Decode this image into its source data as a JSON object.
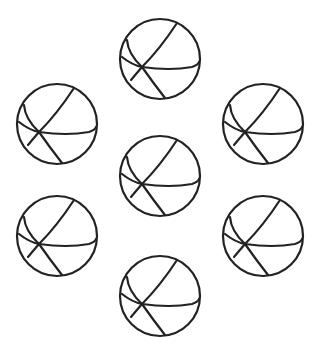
{
  "figure": {
    "background_color": "#ffffff",
    "stroke_color": "#222222",
    "ball_count": 7,
    "balls": [
      {
        "id": "top",
        "cx": 160,
        "cy": 59
      },
      {
        "id": "upper-left",
        "cx": 57,
        "cy": 124
      },
      {
        "id": "upper-right",
        "cx": 263,
        "cy": 124
      },
      {
        "id": "center",
        "cx": 160,
        "cy": 176
      },
      {
        "id": "lower-left",
        "cx": 57,
        "cy": 236
      },
      {
        "id": "lower-right",
        "cx": 263,
        "cy": 236
      },
      {
        "id": "bottom",
        "cx": 160,
        "cy": 296
      }
    ],
    "radius": 40
  }
}
